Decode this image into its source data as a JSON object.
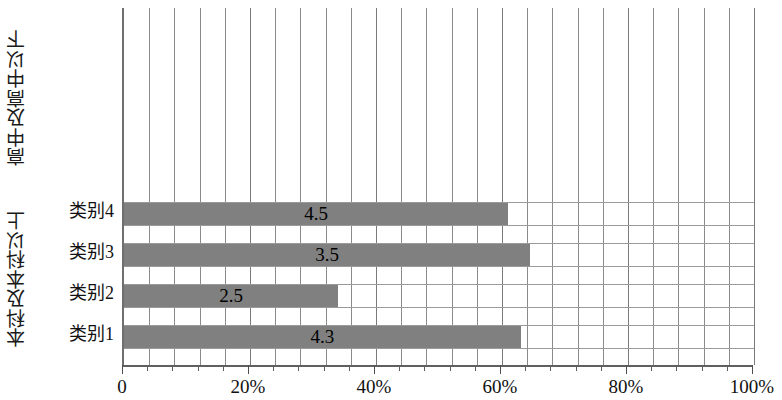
{
  "chart_data": {
    "type": "bar",
    "orientation": "horizontal",
    "title": "",
    "xlabel": "",
    "ylabel": "",
    "categories": [
      "类别1",
      "类别2",
      "类别3",
      "类别4"
    ],
    "values": [
      4.3,
      2.5,
      3.5,
      4.5
    ],
    "value_labels": [
      "4.3",
      "2.5",
      "3.5",
      "4.5"
    ],
    "bar_percents": [
      63.0,
      34.0,
      64.5,
      61.0
    ],
    "xlim": [
      0,
      100
    ],
    "xtick_labels": [
      "0",
      "20%",
      "40%",
      "60%",
      "80%",
      "100%"
    ],
    "xtick_values": [
      0,
      20,
      40,
      60,
      80,
      100
    ],
    "minor_tick_step": 4,
    "grid": true,
    "grid_axis": "x",
    "legend": "none",
    "bar_color": "#808080",
    "grid_color": "#8a8a8a",
    "axis_color": "#5f5f5f",
    "group_titles": {
      "upper": "高中及高中以下",
      "lower": "本科及本科以上"
    }
  }
}
